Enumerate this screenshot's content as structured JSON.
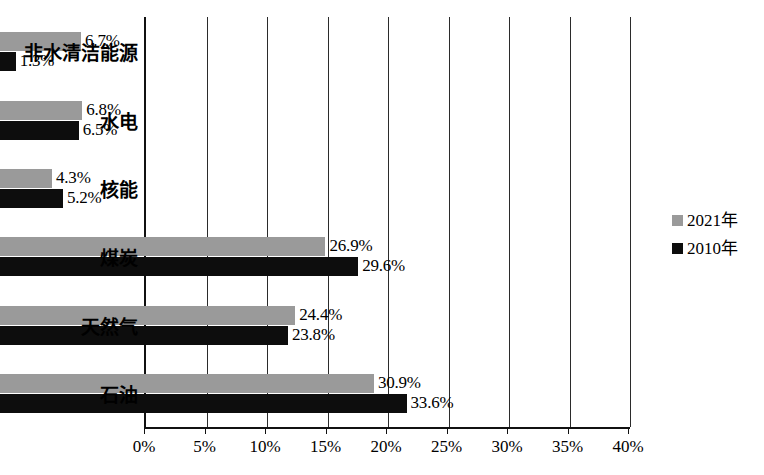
{
  "chart_data": {
    "type": "bar",
    "orientation": "horizontal",
    "title": "",
    "xlabel": "",
    "ylabel": "",
    "xlim": [
      0,
      40
    ],
    "xtick_labels": [
      "0%",
      "5%",
      "10%",
      "15%",
      "20%",
      "25%",
      "30%",
      "35%",
      "40%"
    ],
    "xtick_values": [
      0,
      5,
      10,
      15,
      20,
      25,
      30,
      35,
      40
    ],
    "grid": true,
    "legend_position": "right",
    "categories": [
      "非水清洁能源",
      "水电",
      "核能",
      "煤炭",
      "天然气",
      "石油"
    ],
    "series": [
      {
        "name": "2021年",
        "color": "#9a9a9a",
        "values": [
          6.7,
          6.8,
          4.3,
          26.9,
          24.4,
          30.9
        ],
        "labels": [
          "6.7%",
          "6.8%",
          "4.3%",
          "26.9%",
          "24.4%",
          "30.9%"
        ]
      },
      {
        "name": "2010年",
        "color": "#0d0d0d",
        "values": [
          1.3,
          6.5,
          5.2,
          29.6,
          23.8,
          33.6
        ],
        "labels": [
          "1.3%",
          "6.5%",
          "5.2%",
          "29.6%",
          "23.8%",
          "33.6%"
        ]
      }
    ]
  },
  "legend": {
    "items": [
      {
        "label": "2021年",
        "color": "#9a9a9a"
      },
      {
        "label": "2010年",
        "color": "#0d0d0d"
      }
    ]
  },
  "axis": {
    "ticks": [
      {
        "label": "0%"
      },
      {
        "label": "5%"
      },
      {
        "label": "10%"
      },
      {
        "label": "15%"
      },
      {
        "label": "20%"
      },
      {
        "label": "25%"
      },
      {
        "label": "30%"
      },
      {
        "label": "35%"
      },
      {
        "label": "40%"
      }
    ]
  },
  "categories": [
    {
      "label": "非水清洁能源"
    },
    {
      "label": "水电"
    },
    {
      "label": "核能"
    },
    {
      "label": "煤炭"
    },
    {
      "label": "天然气"
    },
    {
      "label": "石油"
    }
  ]
}
